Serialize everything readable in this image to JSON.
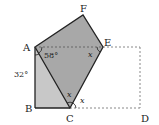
{
  "diagram": {
    "type": "geometry-folding",
    "points": {
      "A": {
        "label": "A",
        "x": 35,
        "y": 47
      },
      "B": {
        "label": "B",
        "x": 35,
        "y": 108
      },
      "C": {
        "label": "C",
        "x": 70,
        "y": 108
      },
      "D": {
        "label": "D",
        "x": 140,
        "y": 108
      },
      "E": {
        "label": "E",
        "x": 103,
        "y": 47
      },
      "F": {
        "label": "F",
        "x": 83,
        "y": 15
      }
    },
    "angles": {
      "angle_58": "58°",
      "angle_32": "32°",
      "x_at_E": "x",
      "x_at_C_inner": "x",
      "x_at_C_outer": "x"
    },
    "colors": {
      "fold_fill": "#a8a8a8",
      "triangle_fill": "#c8c8c8",
      "stroke": "#222222",
      "dashed": "#888888"
    }
  }
}
